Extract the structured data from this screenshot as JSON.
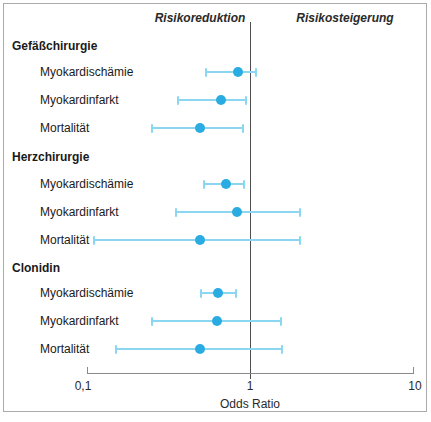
{
  "chart_data": {
    "type": "forest",
    "title": "",
    "region_labels": {
      "left": "Risikoreduktion",
      "right": "Risikosteigerung"
    },
    "x_axis": {
      "label": "Odds Ratio",
      "scale": "log",
      "min": 0.1,
      "max": 10,
      "ticks": [
        0.1,
        1,
        10
      ],
      "tick_labels": [
        "0,1",
        "1",
        "10"
      ],
      "reference_line": 1
    },
    "groups": [
      {
        "label": "Gefäßchirurgie",
        "rows": [
          {
            "label": "Myokardischämie",
            "or": 0.84,
            "ci_low": 0.54,
            "ci_high": 1.09
          },
          {
            "label": "Myokardinfarkt",
            "or": 0.66,
            "ci_low": 0.36,
            "ci_high": 0.94
          },
          {
            "label": "Mortalität",
            "or": 0.49,
            "ci_low": 0.25,
            "ci_high": 0.91
          }
        ]
      },
      {
        "label": "Herzchirurgie",
        "rows": [
          {
            "label": "Myokardischämie",
            "or": 0.71,
            "ci_low": 0.52,
            "ci_high": 0.92
          },
          {
            "label": "Myokardinfarkt",
            "or": 0.83,
            "ci_low": 0.35,
            "ci_high": 2.04
          },
          {
            "label": "Mortalität",
            "or": 0.49,
            "ci_low": 0.11,
            "ci_high": 2.04
          }
        ]
      },
      {
        "label": "Clonidin",
        "rows": [
          {
            "label": "Myokardischämie",
            "or": 0.64,
            "ci_low": 0.5,
            "ci_high": 0.82
          },
          {
            "label": "Myokardinfarkt",
            "or": 0.63,
            "ci_low": 0.25,
            "ci_high": 1.54
          },
          {
            "label": "Mortalität",
            "or": 0.49,
            "ci_low": 0.15,
            "ci_high": 1.58
          }
        ]
      }
    ],
    "colors": {
      "marker": "#2aace3",
      "ci_line": "#8bd6f0",
      "reference_line": "#4f4f4f",
      "axis": "#8a8a8a",
      "text": "#1a1a1a",
      "frame": "#ababab"
    }
  }
}
